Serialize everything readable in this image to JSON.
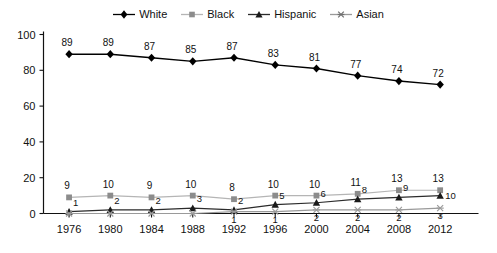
{
  "chart_data": {
    "type": "line",
    "title": "",
    "xlabel": "",
    "ylabel": "",
    "categories": [
      "1976",
      "1980",
      "1984",
      "1988",
      "1992",
      "1996",
      "2000",
      "2004",
      "2008",
      "2012"
    ],
    "ylim": [
      0,
      100
    ],
    "yticks": [
      "0",
      "20",
      "40",
      "60",
      "80",
      "100"
    ],
    "grid": false,
    "legend_position": "top-center",
    "series": [
      {
        "name": "White",
        "marker": "diamond",
        "color": "#000000",
        "line_color": "#000000",
        "values": [
          89,
          89,
          87,
          85,
          87,
          83,
          81,
          77,
          74,
          72
        ],
        "labels": [
          "89",
          "89",
          "87",
          "85",
          "87",
          "83",
          "81",
          "77",
          "74",
          "72"
        ]
      },
      {
        "name": "Black",
        "marker": "square",
        "color": "#8c8c8c",
        "line_color": "#b5b5b5",
        "values": [
          9,
          10,
          9,
          10,
          8,
          10,
          10,
          11,
          13,
          13
        ],
        "labels": [
          "9",
          "10",
          "9",
          "10",
          "8",
          "10",
          "10",
          "11",
          "13",
          "13"
        ]
      },
      {
        "name": "Hispanic",
        "marker": "triangle",
        "color": "#1a1a1a",
        "line_color": "#2b2b2b",
        "values": [
          1,
          2,
          2,
          3,
          2,
          5,
          6,
          8,
          9,
          10
        ],
        "labels": [
          "1",
          "2",
          "2",
          "3",
          "2",
          "5",
          "6",
          "8",
          "9",
          "10"
        ]
      },
      {
        "name": "Asian",
        "marker": "asterisk",
        "color": "#9a9a9a",
        "line_color": "#9a9a9a",
        "values": [
          0,
          0,
          0,
          0,
          1,
          1,
          2,
          2,
          2,
          3
        ],
        "labels": [
          "",
          "",
          "",
          "",
          "1",
          "1",
          "2",
          "2",
          "2",
          "3"
        ]
      }
    ]
  },
  "legend": {
    "items": [
      {
        "label": "White",
        "marker": "diamond"
      },
      {
        "label": "Black",
        "marker": "square"
      },
      {
        "label": "Hispanic",
        "marker": "triangle"
      },
      {
        "label": "Asian",
        "marker": "asterisk"
      }
    ]
  },
  "axes": {
    "y_ticks": [
      "100",
      "80",
      "60",
      "40",
      "20",
      "0"
    ],
    "x_ticks": [
      "1976",
      "1980",
      "1984",
      "1988",
      "1992",
      "1996",
      "2000",
      "2004",
      "2008",
      "2012"
    ]
  }
}
